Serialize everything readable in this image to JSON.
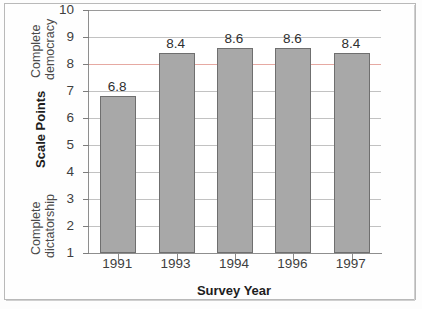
{
  "chart_data": {
    "type": "bar",
    "title": "",
    "categories": [
      "1991",
      "1993",
      "1994",
      "1996",
      "1997"
    ],
    "values": [
      6.8,
      8.4,
      8.6,
      8.6,
      8.4
    ],
    "value_labels": [
      "6.8",
      "8.4",
      "8.6",
      "8.6",
      "8.4"
    ],
    "xlabel": "Survey Year",
    "ylabel": "Scale Points",
    "ylim": [
      1,
      10
    ],
    "yticks": [
      1,
      2,
      3,
      4,
      5,
      6,
      7,
      8,
      9,
      10
    ],
    "ytick_labels": [
      "1",
      "2",
      "3",
      "4",
      "5",
      "6",
      "7",
      "8",
      "9",
      "10"
    ],
    "y_top_annotation": "Complete democracy",
    "y_bottom_annotation": "Complete dictatorship",
    "grid": true,
    "grid_orientation": "horizontal",
    "legend": "none",
    "bar_color": "#a8a8a8",
    "bar_edge_color": "#6f6f6f",
    "accent_gridline_value": 8,
    "accent_gridline_color": "#e6a9a2",
    "grid_color": "#c2c2c2",
    "axis_color": "#8e8e8e"
  },
  "axis": {
    "y_annotation_top_line1": "Complete",
    "y_annotation_top_line2": "democracy",
    "y_annotation_bottom_line1": "Complete",
    "y_annotation_bottom_line2": "dictatorship",
    "y_title": "Scale Points",
    "x_title": "Survey Year"
  }
}
